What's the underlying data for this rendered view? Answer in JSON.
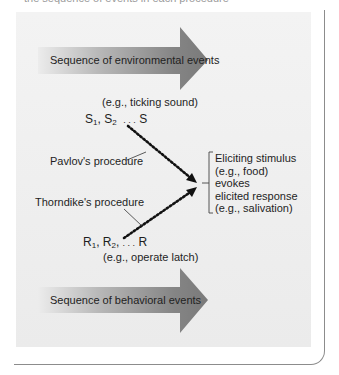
{
  "caption_clipped": "the sequence of events in each procedure",
  "figure": {
    "top_arrow": {
      "label": "Sequence of environmental events"
    },
    "bottom_arrow": {
      "label": "Sequence of behavioral events"
    },
    "stimulus_example": "(e.g., ticking sound)",
    "stimulus_seq": {
      "s1": "S",
      "s1_sub": "1",
      "s2": "S",
      "s2_sub": "2",
      "ellipsis": ". . .",
      "s_last": "S"
    },
    "pavlov_label": "Pavlov's procedure",
    "thorndike_label": "Thorndike's procedure",
    "response_seq": {
      "r1": "R",
      "r1_sub": "1",
      "r2": "R",
      "r2_sub": "2",
      "ellipsis": ". . .",
      "r_last": "R"
    },
    "response_example": "(e.g., operate latch)",
    "outcome_block": [
      "Eliciting stimulus",
      "(e.g., food)",
      "evokes",
      "elicited response",
      "(e.g., salivation)"
    ]
  },
  "colors": {
    "panel": "#eeeeee",
    "arrow_dark": "#777777",
    "arrow_light": "#e8e8e8",
    "frame": "#8c8c8c",
    "text": "#1e1e1e"
  }
}
